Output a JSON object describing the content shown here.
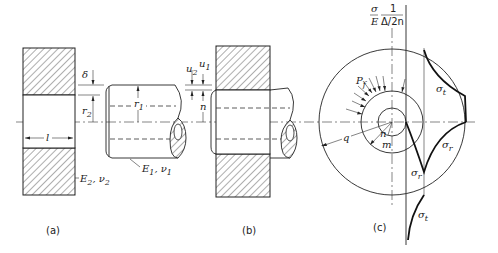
{
  "figure": {
    "panels": [
      {
        "id": "a",
        "caption": "(a)"
      },
      {
        "id": "b",
        "caption": "(b)"
      },
      {
        "id": "c",
        "caption": "(c)"
      }
    ],
    "labels_a": {
      "delta": "δ",
      "r2": "r",
      "r2_sub": "2",
      "r1": "r",
      "r1_sub": "1",
      "l": "l",
      "E2": "E",
      "E2_sub": "2",
      "nu2": ", ν",
      "nu2_sub": "2",
      "E1": "E",
      "E1_sub": "1",
      "nu1": ", ν",
      "nu1_sub": "1"
    },
    "labels_b": {
      "u1": "u",
      "u1_sub": "1",
      "u2": "u",
      "u2_sub": "2",
      "n": "n"
    },
    "labels_c": {
      "axis_sigma": "σ",
      "axis_E": "E",
      "axis_one": "1",
      "axis_delta": "Δ/2n",
      "Pf": "P",
      "Pf_sub": "f",
      "q": "q",
      "n": "n",
      "m": "m",
      "sigma_t_top": "σ",
      "sigma_t_top_sub": "t",
      "sigma_r_right": "σ",
      "sigma_r_right_sub": "r",
      "sigma_r_low": "σ",
      "sigma_r_low_sub": "r",
      "sigma_t_bottom": "σ",
      "sigma_t_bottom_sub": "t"
    }
  }
}
